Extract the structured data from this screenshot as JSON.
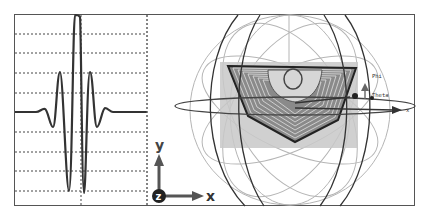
{
  "figure": {
    "left_panel": {
      "type": "wavelet-waveform",
      "description": "Oscillating wavelet (Gabor-like) on dashed grid",
      "grid_rows": 9,
      "vertical_dashed_lines": 2
    },
    "axes_indicator": {
      "x_label": "x",
      "y_label": "y",
      "z_label": "z"
    },
    "right_panel": {
      "type": "3d-sphere-projection",
      "labels": {
        "phi": "Phi",
        "theta": "Theta",
        "x": "x"
      }
    }
  },
  "colors": {
    "stroke_dark": "#333333",
    "stroke_light": "#b5b5b5",
    "plane_fill": "#c8c8c8",
    "frame": "#555555"
  }
}
